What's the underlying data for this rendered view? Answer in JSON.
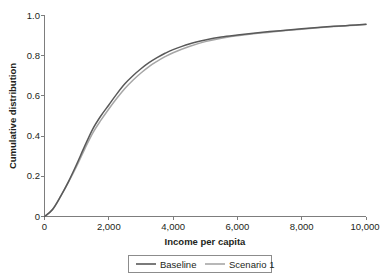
{
  "chart_data": {
    "type": "line",
    "title": "",
    "xlabel": "Income per capita",
    "ylabel": "Cumulative distribution",
    "xlim": [
      0,
      10000
    ],
    "ylim": [
      0,
      1.0
    ],
    "grid": false,
    "legend_position": "bottom-center",
    "xticks": [
      0,
      2000,
      4000,
      6000,
      8000,
      10000
    ],
    "xtick_labels": [
      "0",
      "2,000",
      "4,000",
      "6,000",
      "8,000",
      "10,000"
    ],
    "yticks": [
      0,
      0.2,
      0.4,
      0.6,
      0.8,
      1.0
    ],
    "ytick_labels": [
      "0",
      "0.2",
      "0.4",
      "0.6",
      "0.8",
      "1.0"
    ],
    "x": [
      0,
      250,
      500,
      750,
      1000,
      1250,
      1500,
      1750,
      2000,
      2250,
      2500,
      2750,
      3000,
      3250,
      3500,
      3750,
      4000,
      4500,
      5000,
      5500,
      6000,
      6500,
      7000,
      7500,
      8000,
      8500,
      9000,
      9500,
      10000
    ],
    "series": [
      {
        "name": "Baseline",
        "color": "#595959",
        "values": [
          0.0,
          0.035,
          0.1,
          0.175,
          0.26,
          0.35,
          0.435,
          0.5,
          0.555,
          0.61,
          0.66,
          0.7,
          0.735,
          0.765,
          0.79,
          0.812,
          0.83,
          0.858,
          0.878,
          0.893,
          0.903,
          0.912,
          0.92,
          0.927,
          0.934,
          0.94,
          0.946,
          0.951,
          0.956
        ]
      },
      {
        "name": "Scenario 1",
        "color": "#a6a6a6",
        "values": [
          0.0,
          0.035,
          0.1,
          0.172,
          0.25,
          0.335,
          0.415,
          0.478,
          0.535,
          0.588,
          0.637,
          0.678,
          0.714,
          0.746,
          0.772,
          0.795,
          0.815,
          0.846,
          0.87,
          0.887,
          0.899,
          0.909,
          0.917,
          0.925,
          0.932,
          0.939,
          0.945,
          0.95,
          0.955
        ]
      }
    ]
  },
  "legend": {
    "items": [
      {
        "label": "Baseline"
      },
      {
        "label": "Scenario 1"
      }
    ]
  }
}
